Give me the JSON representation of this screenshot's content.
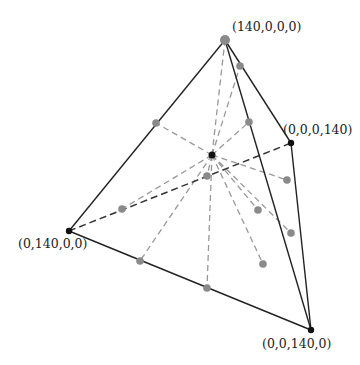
{
  "vertices": [
    {
      "id": "A",
      "label": "(140,0,0,0)",
      "x": 225,
      "y": 40,
      "lx": 232,
      "ly": 31
    },
    {
      "id": "B",
      "label": "(0,140,0,0)",
      "x": 69,
      "y": 231,
      "lx": 18,
      "ly": 248
    },
    {
      "id": "C",
      "label": "(0,0,140,0)",
      "x": 311,
      "y": 330,
      "lx": 262,
      "ly": 348
    },
    {
      "id": "D",
      "label": "(0,0,0,140)",
      "x": 291,
      "y": 143,
      "lx": 283,
      "ly": 134
    }
  ],
  "center": {
    "x": 212,
    "y": 155
  },
  "solid_edges": [
    [
      "A",
      "B"
    ],
    [
      "A",
      "C"
    ],
    [
      "A",
      "D"
    ],
    [
      "B",
      "C"
    ],
    [
      "D",
      "C"
    ]
  ],
  "hidden_edges": [
    [
      "B",
      "D"
    ]
  ],
  "gray_points": [
    {
      "x": 240,
      "y": 66
    },
    {
      "x": 156,
      "y": 123
    },
    {
      "x": 249,
      "y": 122
    },
    {
      "x": 207,
      "y": 176
    },
    {
      "x": 122,
      "y": 209
    },
    {
      "x": 287,
      "y": 180
    },
    {
      "x": 258,
      "y": 210
    },
    {
      "x": 291,
      "y": 233
    },
    {
      "x": 263,
      "y": 264
    },
    {
      "x": 140,
      "y": 261
    },
    {
      "x": 207,
      "y": 288
    }
  ],
  "colors": {
    "edge": "#222222",
    "hidden": "#333333",
    "ray": "#999999",
    "point": "#8a8a8a",
    "vertex": "#111111"
  }
}
